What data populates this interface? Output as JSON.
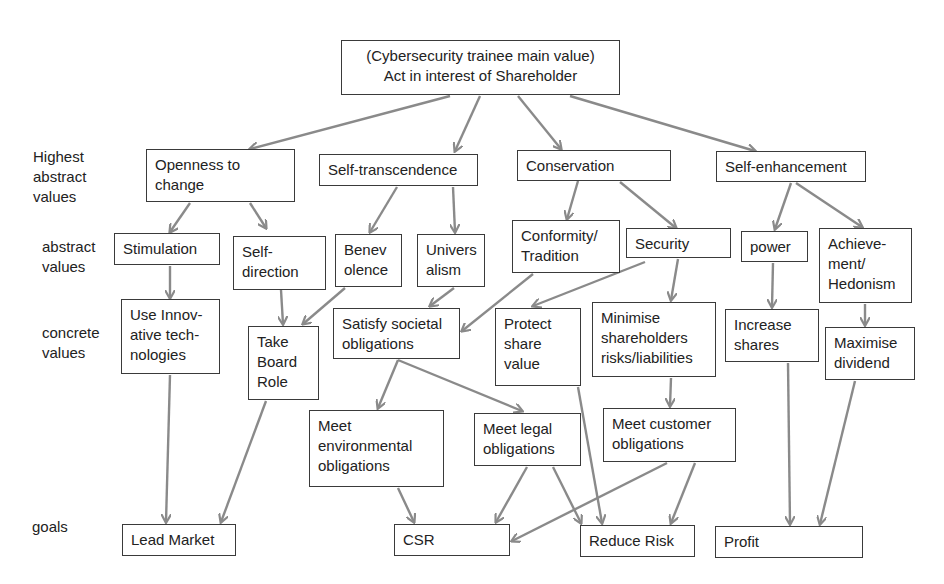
{
  "diagram": {
    "type": "value-hierarchy",
    "colors": {
      "edge": "#8a8a8a",
      "border": "#3a3a3a",
      "text": "#222222",
      "background": "#ffffff"
    },
    "level_labels": [
      {
        "id": "lvl-highest",
        "text": "Highest\nabstract\nvalues",
        "x": 33,
        "y": 147
      },
      {
        "id": "lvl-abstract",
        "text": "abstract\nvalues",
        "x": 42,
        "y": 237
      },
      {
        "id": "lvl-concrete",
        "text": "concrete\nvalues",
        "x": 42,
        "y": 323
      },
      {
        "id": "lvl-goals",
        "text": "goals",
        "x": 32,
        "y": 517
      }
    ],
    "nodes": [
      {
        "id": "root",
        "text": "(Cybersecurity trainee main value)\nAct in interest of Shareholder",
        "x": 341,
        "y": 40,
        "w": 279,
        "h": 55,
        "center": true
      },
      {
        "id": "openness",
        "text": "Openness to\nchange",
        "x": 146,
        "y": 149,
        "w": 149,
        "h": 53
      },
      {
        "id": "self-transcendence",
        "text": "Self-transcendence",
        "x": 319,
        "y": 154,
        "w": 159,
        "h": 32
      },
      {
        "id": "conservation",
        "text": "Conservation",
        "x": 517,
        "y": 150,
        "w": 154,
        "h": 31
      },
      {
        "id": "self-enhancement",
        "text": "Self-enhancement",
        "x": 716,
        "y": 151,
        "w": 150,
        "h": 31
      },
      {
        "id": "stimulation",
        "text": "Stimulation",
        "x": 114,
        "y": 233,
        "w": 106,
        "h": 32
      },
      {
        "id": "self-direction",
        "text": "Self-\ndirection",
        "x": 233,
        "y": 236,
        "w": 93,
        "h": 54
      },
      {
        "id": "benevolence",
        "text": "Benev\nolence",
        "x": 335,
        "y": 234,
        "w": 67,
        "h": 53
      },
      {
        "id": "universalism",
        "text": "Univers\nalism",
        "x": 417,
        "y": 234,
        "w": 68,
        "h": 53
      },
      {
        "id": "conformity",
        "text": "Conformity/\nTradition",
        "x": 512,
        "y": 220,
        "w": 108,
        "h": 53
      },
      {
        "id": "security",
        "text": "Security",
        "x": 626,
        "y": 228,
        "w": 105,
        "h": 30
      },
      {
        "id": "power",
        "text": "power",
        "x": 741,
        "y": 231,
        "w": 67,
        "h": 31
      },
      {
        "id": "achievement",
        "text": "Achieve-\nment/\nHedonism",
        "x": 819,
        "y": 228,
        "w": 93,
        "h": 75
      },
      {
        "id": "innovative",
        "text": "Use Innov-\native tech-\nnologies",
        "x": 121,
        "y": 299,
        "w": 99,
        "h": 75
      },
      {
        "id": "board-role",
        "text": "Take\nBoard\nRole",
        "x": 248,
        "y": 326,
        "w": 71,
        "h": 74
      },
      {
        "id": "societal",
        "text": "Satisfy societal\nobligations",
        "x": 333,
        "y": 308,
        "w": 127,
        "h": 51
      },
      {
        "id": "protect-share",
        "text": "Protect\nshare\nvalue",
        "x": 495,
        "y": 308,
        "w": 86,
        "h": 78
      },
      {
        "id": "minimise-risk",
        "text": "Minimise\nshareholders\nrisks/liabilities",
        "x": 592,
        "y": 302,
        "w": 124,
        "h": 75
      },
      {
        "id": "increase-shares",
        "text": "Increase\nshares",
        "x": 725,
        "y": 309,
        "w": 94,
        "h": 53
      },
      {
        "id": "max-dividend",
        "text": "Maximise\ndividend",
        "x": 825,
        "y": 327,
        "w": 90,
        "h": 53
      },
      {
        "id": "environmental",
        "text": "Meet\nenvironmental\nobligations",
        "x": 309,
        "y": 410,
        "w": 135,
        "h": 77
      },
      {
        "id": "legal",
        "text": "Meet legal\nobligations",
        "x": 474,
        "y": 413,
        "w": 107,
        "h": 53
      },
      {
        "id": "customer",
        "text": "Meet customer\nobligations",
        "x": 603,
        "y": 408,
        "w": 133,
        "h": 54
      },
      {
        "id": "lead-market",
        "text": "Lead Market",
        "x": 122,
        "y": 524,
        "w": 114,
        "h": 32
      },
      {
        "id": "csr",
        "text": "CSR",
        "x": 394,
        "y": 524,
        "w": 116,
        "h": 32
      },
      {
        "id": "reduce-risk",
        "text": "Reduce Risk",
        "x": 580,
        "y": 525,
        "w": 115,
        "h": 32
      },
      {
        "id": "profit",
        "text": "Profit",
        "x": 715,
        "y": 526,
        "w": 148,
        "h": 32
      }
    ],
    "edges": [
      {
        "from": "root",
        "to": "openness",
        "x1": 450,
        "y1": 96,
        "x2": 250,
        "y2": 149
      },
      {
        "from": "root",
        "to": "self-transcendence",
        "x1": 480,
        "y1": 96,
        "x2": 455,
        "y2": 151
      },
      {
        "from": "root",
        "to": "conservation",
        "x1": 518,
        "y1": 96,
        "x2": 561,
        "y2": 149
      },
      {
        "from": "root",
        "to": "self-enhancement",
        "x1": 570,
        "y1": 96,
        "x2": 755,
        "y2": 151
      },
      {
        "from": "openness",
        "to": "stimulation",
        "x1": 190,
        "y1": 203,
        "x2": 170,
        "y2": 232
      },
      {
        "from": "openness",
        "to": "self-direction",
        "x1": 250,
        "y1": 203,
        "x2": 266,
        "y2": 228
      },
      {
        "from": "self-transcendence",
        "to": "benevolence",
        "x1": 397,
        "y1": 187,
        "x2": 370,
        "y2": 232
      },
      {
        "from": "self-transcendence",
        "to": "universalism",
        "x1": 453,
        "y1": 187,
        "x2": 455,
        "y2": 232
      },
      {
        "from": "conservation",
        "to": "conformity",
        "x1": 578,
        "y1": 181,
        "x2": 567,
        "y2": 219
      },
      {
        "from": "conservation",
        "to": "security",
        "x1": 620,
        "y1": 182,
        "x2": 676,
        "y2": 228
      },
      {
        "from": "self-enhancement",
        "to": "power",
        "x1": 791,
        "y1": 183,
        "x2": 775,
        "y2": 229
      },
      {
        "from": "self-enhancement",
        "to": "achievement",
        "x1": 796,
        "y1": 183,
        "x2": 862,
        "y2": 227
      },
      {
        "from": "stimulation",
        "to": "innovative",
        "x1": 170,
        "y1": 266,
        "x2": 170,
        "y2": 298
      },
      {
        "from": "self-direction",
        "to": "board-role",
        "x1": 281,
        "y1": 290,
        "x2": 283,
        "y2": 324
      },
      {
        "from": "benevolence",
        "to": "board-role",
        "x1": 345,
        "y1": 288,
        "x2": 303,
        "y2": 324
      },
      {
        "from": "universalism",
        "to": "societal",
        "x1": 454,
        "y1": 288,
        "x2": 430,
        "y2": 306
      },
      {
        "from": "conformity",
        "to": "societal",
        "x1": 533,
        "y1": 274,
        "x2": 462,
        "y2": 331
      },
      {
        "from": "security",
        "to": "protect-share",
        "x1": 645,
        "y1": 262,
        "x2": 533,
        "y2": 306
      },
      {
        "from": "security",
        "to": "minimise-risk",
        "x1": 678,
        "y1": 259,
        "x2": 671,
        "y2": 300
      },
      {
        "from": "power",
        "to": "increase-shares",
        "x1": 773,
        "y1": 263,
        "x2": 772,
        "y2": 307
      },
      {
        "from": "achievement",
        "to": "max-dividend",
        "x1": 865,
        "y1": 304,
        "x2": 865,
        "y2": 325
      },
      {
        "from": "societal",
        "to": "environmental",
        "x1": 398,
        "y1": 360,
        "x2": 378,
        "y2": 408
      },
      {
        "from": "societal",
        "to": "legal",
        "x1": 398,
        "y1": 360,
        "x2": 522,
        "y2": 411
      },
      {
        "from": "minimise-risk",
        "to": "customer",
        "x1": 671,
        "y1": 378,
        "x2": 670,
        "y2": 406
      },
      {
        "from": "innovative",
        "to": "lead-market",
        "x1": 170,
        "y1": 375,
        "x2": 166,
        "y2": 522
      },
      {
        "from": "board-role",
        "to": "lead-market",
        "x1": 266,
        "y1": 401,
        "x2": 221,
        "y2": 522
      },
      {
        "from": "environmental",
        "to": "csr",
        "x1": 398,
        "y1": 488,
        "x2": 414,
        "y2": 522
      },
      {
        "from": "legal",
        "to": "csr",
        "x1": 527,
        "y1": 467,
        "x2": 496,
        "y2": 522
      },
      {
        "from": "legal",
        "to": "reduce-risk",
        "x1": 553,
        "y1": 467,
        "x2": 581,
        "y2": 523
      },
      {
        "from": "protect-share",
        "to": "reduce-risk",
        "x1": 578,
        "y1": 387,
        "x2": 602,
        "y2": 523
      },
      {
        "from": "customer",
        "to": "csr",
        "x1": 667,
        "y1": 463,
        "x2": 512,
        "y2": 541
      },
      {
        "from": "customer",
        "to": "reduce-risk",
        "x1": 695,
        "y1": 463,
        "x2": 671,
        "y2": 523
      },
      {
        "from": "increase-shares",
        "to": "profit",
        "x1": 788,
        "y1": 363,
        "x2": 790,
        "y2": 524
      },
      {
        "from": "max-dividend",
        "to": "profit",
        "x1": 855,
        "y1": 381,
        "x2": 820,
        "y2": 524
      }
    ]
  }
}
